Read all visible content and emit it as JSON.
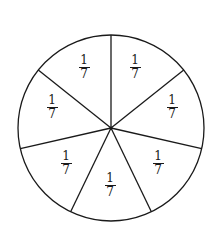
{
  "diagram": {
    "type": "fraction-circle",
    "title": "",
    "center": [
      111,
      128
    ],
    "radius": 93,
    "divisions": 7,
    "start_angle_deg": 90,
    "stroke_color": "#1a1a1a",
    "fill_color": "#ffffff",
    "sectors": [
      {
        "numerator": "1",
        "denominator": "7",
        "label_pos": [
          135,
          70
        ]
      },
      {
        "numerator": "1",
        "denominator": "7",
        "label_pos": [
          172,
          110
        ]
      },
      {
        "numerator": "1",
        "denominator": "7",
        "label_pos": [
          158,
          166
        ]
      },
      {
        "numerator": "1",
        "denominator": "7",
        "label_pos": [
          110,
          188
        ]
      },
      {
        "numerator": "1",
        "denominator": "7",
        "label_pos": [
          66,
          166
        ]
      },
      {
        "numerator": "1",
        "denominator": "7",
        "label_pos": [
          52,
          110
        ]
      },
      {
        "numerator": "1",
        "denominator": "7",
        "label_pos": [
          84,
          70
        ]
      }
    ]
  }
}
